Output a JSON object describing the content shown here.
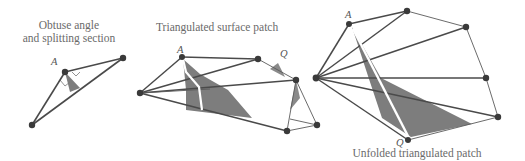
{
  "panels": [
    {
      "id": "obtuse",
      "caption_line1": "Obtuse angle",
      "caption_line2": "and splitting section",
      "labels": {
        "A": "A"
      }
    },
    {
      "id": "triangulated",
      "caption": "Triangulated surface patch",
      "labels": {
        "A": "A",
        "Q": "Q"
      }
    },
    {
      "id": "unfolded",
      "caption": "Unfolded triangulated patch",
      "labels": {
        "A": "A",
        "Q": "Q"
      }
    }
  ],
  "colors": {
    "edge": "#4a4a4a",
    "vertex": "#3a3a3a",
    "shade": "#7d7d7d",
    "path": "#ffffff",
    "text": "#6a6a6a"
  }
}
